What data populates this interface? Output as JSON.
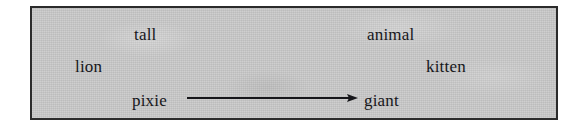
{
  "figure": {
    "background_color": "#c9c9c9",
    "border_color": "#2b2b2b",
    "text_color": "#16161a",
    "words": [
      {
        "id": "tall",
        "label": "tall",
        "x": 102,
        "y": 17
      },
      {
        "id": "animal",
        "label": "animal",
        "x": 335,
        "y": 17
      },
      {
        "id": "lion",
        "label": "lion",
        "x": 43,
        "y": 49
      },
      {
        "id": "kitten",
        "label": "kitten",
        "x": 394,
        "y": 49
      },
      {
        "id": "pixie",
        "label": "pixie",
        "x": 100,
        "y": 83
      },
      {
        "id": "giant",
        "label": "giant",
        "x": 332,
        "y": 83
      }
    ],
    "arrow": {
      "name": "pixie-to-giant-arrow",
      "from_label": "pixie",
      "to_label": "giant",
      "x1": 155,
      "y1": 90,
      "x2": 326,
      "y2": 90,
      "stroke_color": "#16161a",
      "stroke_width": 1.6,
      "head_length": 11,
      "head_width": 8
    }
  }
}
